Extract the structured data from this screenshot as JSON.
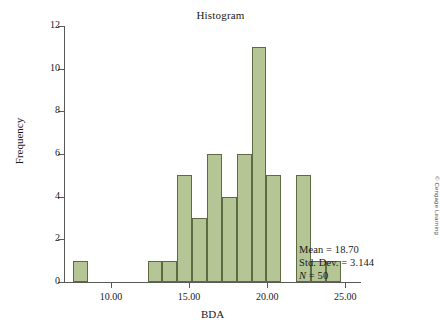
{
  "chart_data": {
    "type": "bar",
    "title": "Histogram",
    "xlabel": "BDA",
    "ylabel": "Frequency",
    "xlim": [
      7.0,
      26.0
    ],
    "ylim": [
      0,
      12
    ],
    "grid": false,
    "legend": "none",
    "xticks": [
      "10.00",
      "15.00",
      "20.00",
      "25.00"
    ],
    "xtick_values": [
      10,
      15,
      20,
      25
    ],
    "yticks": [
      "0",
      "2",
      "4",
      "6",
      "8",
      "10",
      "12"
    ],
    "ytick_values": [
      0,
      2,
      4,
      6,
      8,
      10,
      12
    ],
    "bin_width": 0.95,
    "bins": [
      {
        "left": 7.6,
        "right": 8.55,
        "value": 1
      },
      {
        "left": 8.55,
        "right": 9.5,
        "value": 0
      },
      {
        "left": 9.5,
        "right": 10.45,
        "value": 0
      },
      {
        "left": 10.45,
        "right": 11.4,
        "value": 0
      },
      {
        "left": 11.4,
        "right": 12.35,
        "value": 0
      },
      {
        "left": 12.35,
        "right": 13.3,
        "value": 1
      },
      {
        "left": 13.3,
        "right": 14.25,
        "value": 1
      },
      {
        "left": 14.25,
        "right": 15.2,
        "value": 5
      },
      {
        "left": 15.2,
        "right": 16.15,
        "value": 3
      },
      {
        "left": 16.15,
        "right": 17.1,
        "value": 6
      },
      {
        "left": 17.1,
        "right": 18.05,
        "value": 4
      },
      {
        "left": 18.05,
        "right": 19.0,
        "value": 6
      },
      {
        "left": 19.0,
        "right": 19.95,
        "value": 11
      },
      {
        "left": 19.95,
        "right": 20.9,
        "value": 5
      },
      {
        "left": 20.9,
        "right": 21.85,
        "value": 0
      },
      {
        "left": 21.85,
        "right": 22.8,
        "value": 5
      },
      {
        "left": 22.8,
        "right": 23.75,
        "value": 1
      },
      {
        "left": 23.75,
        "right": 24.7,
        "value": 1
      }
    ],
    "categories": [
      "8.1",
      "9.0",
      "10.0",
      "10.9",
      "11.9",
      "12.8",
      "13.8",
      "14.7",
      "15.7",
      "16.6",
      "17.6",
      "18.5",
      "19.5",
      "20.4",
      "21.4",
      "22.3",
      "23.3",
      "24.2"
    ],
    "values": [
      1,
      0,
      0,
      0,
      0,
      1,
      1,
      5,
      3,
      6,
      4,
      6,
      11,
      5,
      0,
      5,
      1,
      1
    ],
    "bar_color": "#b6c596",
    "bar_edge_color": "#5d6b42",
    "axis_color": "#595959"
  },
  "annotations": {
    "mean": "Mean = 18.70",
    "std_dev": "Std. Dev. = 3.144",
    "n_label": "N",
    "n_value": "= 50"
  },
  "copyright": "© Cengage Learning"
}
